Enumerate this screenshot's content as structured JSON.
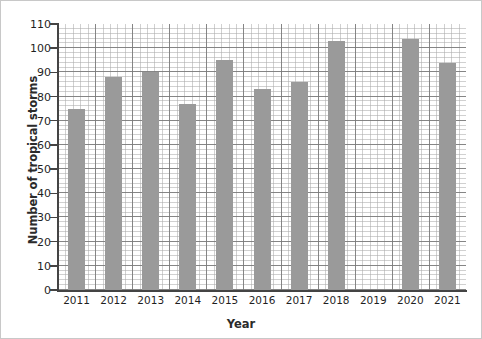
{
  "chart_data": {
    "type": "bar",
    "title": "",
    "xlabel": "Year",
    "ylabel": "Number of tropical storms",
    "categories": [
      "2011",
      "2012",
      "2013",
      "2014",
      "2015",
      "2016",
      "2017",
      "2018",
      "2019",
      "2020",
      "2021"
    ],
    "values": [
      75,
      88,
      90,
      77,
      95,
      83,
      86,
      103,
      null,
      104,
      94
    ],
    "ylim": [
      0,
      110
    ],
    "ytick_step": 10,
    "yticks": [
      0,
      10,
      20,
      30,
      40,
      50,
      60,
      70,
      80,
      90,
      100,
      110
    ],
    "grid": true,
    "grid_style": "graph-paper",
    "legend": null,
    "bar_color": "#9a9a9a",
    "axis_color": "#444444",
    "major_grid_color": "#787878",
    "minor_grid_color": "#aaaaaa",
    "background_color": "#ffffff"
  }
}
